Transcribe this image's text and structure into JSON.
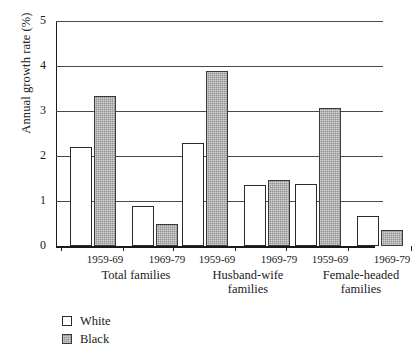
{
  "chart_data": {
    "type": "bar",
    "title": "",
    "xlabel": "",
    "ylabel": "Annual growth rate (%)",
    "ylim": [
      0,
      5
    ],
    "yticks": [
      "0",
      "1",
      "2",
      "3",
      "4",
      "5"
    ],
    "grid": true,
    "legend_position": "below-left",
    "categories": [
      "Total families 1959-69",
      "Total families 1969-79",
      "Husband-wife families 1959-69",
      "Husband-wife families 1969-79",
      "Female-headed families 1959-69",
      "Female-headed families 1969-79"
    ],
    "series": [
      {
        "name": "White",
        "values": [
          2.2,
          0.9,
          2.3,
          1.36,
          1.38,
          0.67
        ]
      },
      {
        "name": "Black",
        "values": [
          3.33,
          0.48,
          3.89,
          1.47,
          3.07,
          0.36
        ]
      }
    ],
    "groups": [
      {
        "group_label_line1": "Total families",
        "group_label_line2": "",
        "periods": [
          {
            "label": "1959-69",
            "white": 2.2,
            "black": 3.33
          },
          {
            "label": "1969-79",
            "white": 0.9,
            "black": 0.48
          }
        ]
      },
      {
        "group_label_line1": "Husband-wife",
        "group_label_line2": "families",
        "periods": [
          {
            "label": "1959-69",
            "white": 2.3,
            "black": 3.89
          },
          {
            "label": "1969-79",
            "white": 1.36,
            "black": 1.47
          }
        ]
      },
      {
        "group_label_line1": "Female-headed",
        "group_label_line2": "families",
        "periods": [
          {
            "label": "1959-69",
            "white": 1.38,
            "black": 3.07
          },
          {
            "label": "1969-79",
            "white": 0.67,
            "black": 0.36
          }
        ]
      }
    ],
    "legend": [
      {
        "label": "White",
        "swatch": "open-square",
        "color": "#ffffff"
      },
      {
        "label": "Black",
        "swatch": "stippled-square",
        "color": "#939393"
      }
    ],
    "colors": {
      "white_bar": "#ffffff",
      "black_bar": "#939393",
      "bar_outline": "#2a2a2a",
      "gridline": "#4a4a4a",
      "axis": "#1a1a1a",
      "background": "#ffffff"
    }
  }
}
